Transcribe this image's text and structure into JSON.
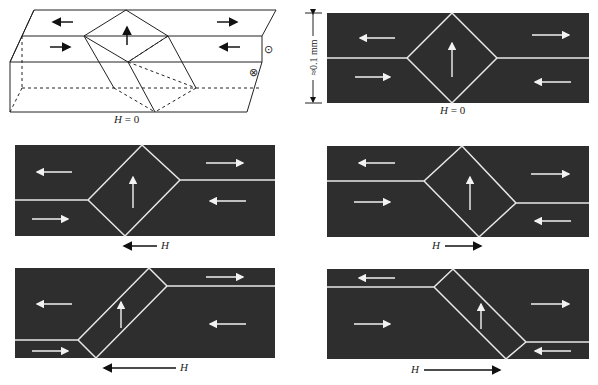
{
  "figure": {
    "panels": [
      {
        "id": "3d-block",
        "caption_var": "H",
        "caption_rest": " = 0"
      },
      {
        "id": "top-right",
        "caption_var": "H",
        "caption_rest": " = 0"
      },
      {
        "id": "mid-left",
        "caption_var": "H",
        "caption_rest": ""
      },
      {
        "id": "mid-right",
        "caption_var": "H",
        "caption_rest": ""
      },
      {
        "id": "bot-left",
        "caption_var": "H",
        "caption_rest": ""
      },
      {
        "id": "bot-right",
        "caption_var": "H",
        "caption_rest": ""
      }
    ],
    "scale_label": "≈0.1 mm",
    "symbols": {
      "out_of_page": "⊙",
      "into_page": "⊗"
    },
    "colors": {
      "domain_fill": "#2e2e2e",
      "wall": "#e8e8e8",
      "ink": "#111111"
    }
  }
}
